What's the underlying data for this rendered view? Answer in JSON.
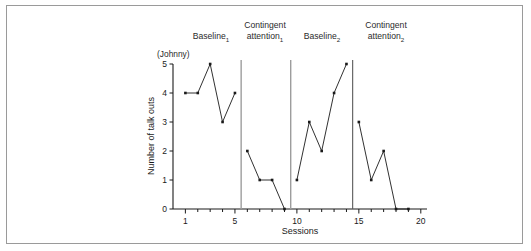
{
  "figure": {
    "subject_label": "(Johnny)",
    "border_color": "#9a9a9a",
    "line_color": "#1a1a1a"
  },
  "chart_data": {
    "type": "line",
    "title": "",
    "subtitle": "(Johnny)",
    "xlabel": "Sessions",
    "ylabel": "Number of talk outs",
    "xlim": [
      0,
      20.5
    ],
    "ylim": [
      0,
      5
    ],
    "xticks": [
      1,
      5,
      10,
      15,
      20
    ],
    "yticks": [
      0,
      1,
      2,
      3,
      4,
      5
    ],
    "xtick_labels": [
      "1",
      "5",
      "10",
      "15",
      "20"
    ],
    "ytick_labels": [
      "0",
      "1",
      "2",
      "3",
      "4",
      "5"
    ],
    "grid": false,
    "legend": "none",
    "x": [
      1,
      2,
      3,
      4,
      5,
      6,
      7,
      8,
      9,
      10,
      11,
      12,
      13,
      14,
      15,
      16,
      17,
      18,
      19
    ],
    "values": [
      4,
      4,
      5,
      3,
      4,
      2,
      1,
      1,
      0,
      1,
      3,
      2,
      4,
      5,
      3,
      1,
      2,
      0,
      0
    ],
    "phases": [
      {
        "label": "Baseline",
        "subscript": "1",
        "x_start": 1,
        "x_end": 5,
        "values": [
          4,
          4,
          5,
          3,
          4
        ],
        "label_x": 5.0
      },
      {
        "label": "Contingent attention",
        "subscript": "1",
        "x_start": 6,
        "x_end": 9,
        "values": [
          2,
          1,
          1,
          0
        ],
        "label_x": 8.0
      },
      {
        "label": "Baseline",
        "subscript": "2",
        "x_start": 10,
        "x_end": 14,
        "values": [
          1,
          3,
          2,
          4,
          5
        ],
        "label_x": 12.5
      },
      {
        "label": "Contingent attention",
        "subscript": "2",
        "x_start": 15,
        "x_end": 18,
        "values": [
          3,
          1,
          2,
          0
        ],
        "label_x": 17.0
      }
    ],
    "phase_dividers": [
      5.5,
      9.5,
      14.5
    ]
  }
}
